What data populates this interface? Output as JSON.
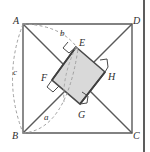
{
  "figure": {
    "type": "geometry-diagram",
    "background_color": "#ffffff",
    "stroke_color": "#4a4a4a",
    "dashed_color": "#9a9a9a",
    "shade_fill": "#d8d8d8",
    "outer_square": {
      "name": "ABCD",
      "vertices": [
        {
          "label": "A",
          "x": 23,
          "y": 24,
          "label_x": 13,
          "label_y": 16
        },
        {
          "label": "D",
          "x": 132,
          "y": 24,
          "label_x": 133,
          "label_y": 16
        },
        {
          "label": "C",
          "x": 132,
          "y": 133,
          "label_x": 133,
          "label_y": 131
        },
        {
          "label": "B",
          "x": 23,
          "y": 133,
          "label_x": 12,
          "label_y": 131
        }
      ]
    },
    "inner_square": {
      "name": "EFGH",
      "vertices": [
        {
          "label": "E",
          "x": 76,
          "y": 47,
          "label_x": 79,
          "label_y": 38
        },
        {
          "label": "H",
          "x": 105,
          "y": 72,
          "label_x": 108,
          "label_y": 72
        },
        {
          "label": "G",
          "x": 80,
          "y": 104,
          "label_x": 78,
          "label_y": 110
        },
        {
          "label": "F",
          "x": 52,
          "y": 80,
          "label_x": 41,
          "label_y": 73
        }
      ]
    },
    "right_angle_marks": [
      "E",
      "F",
      "G",
      "H"
    ],
    "arc_labels": [
      {
        "label": "a",
        "x": 44,
        "y": 113
      },
      {
        "label": "b",
        "x": 60,
        "y": 29
      },
      {
        "label": "c",
        "x": 13,
        "y": 68
      }
    ],
    "page_edge": {
      "x": 143,
      "color": "#5d5d5d"
    }
  }
}
